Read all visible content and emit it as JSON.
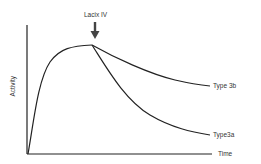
{
  "diagram": {
    "annotation": "Lacix IV",
    "y_axis_label": "Activity",
    "x_axis_label": "Time",
    "series": [
      {
        "name": "Type 3b",
        "label": "Type 3b"
      },
      {
        "name": "Type3a",
        "label": "Type3a"
      }
    ],
    "colors": {
      "line": "#222222",
      "text": "#333333",
      "background": "#ffffff"
    }
  }
}
